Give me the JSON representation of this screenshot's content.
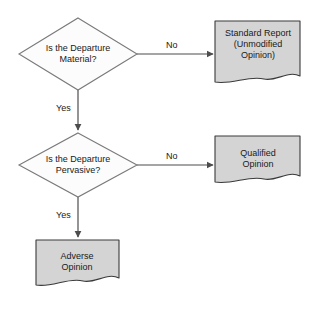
{
  "diagram": {
    "background_color": "#ffffff",
    "decision_fill": "#fcfcfc",
    "decision_stroke": "#7a7a7a",
    "document_fill": "#d4d4d4",
    "document_stroke": "#3a3a3a",
    "connector_color": "#4d4d4d",
    "text_color": "#1a1a1a"
  },
  "nodes": {
    "decision_material": {
      "shape": "diamond",
      "line1": "Is the Departure",
      "line2": "Material?",
      "text": "Is the Departure\nMaterial?"
    },
    "decision_pervasive": {
      "shape": "diamond",
      "line1": "Is the Departure",
      "line2": "Pervasive?",
      "text": "Is the Departure\nPervasive?"
    },
    "doc_standard_report": {
      "shape": "document",
      "line1": "Standard Report",
      "line2": "(Unmodified",
      "line3": "Opinion)",
      "text": "Standard Report\n(Unmodified\nOpinion)"
    },
    "doc_qualified_opinion": {
      "shape": "document",
      "line1": "Qualified",
      "line2": "Opinion",
      "text": "Qualified\nOpinion"
    },
    "doc_adverse_opinion": {
      "shape": "document",
      "line1": "Adverse",
      "line2": "Opinion",
      "text": "Adverse\nOpinion"
    }
  },
  "edges": {
    "material_no": {
      "label": "No",
      "from": "decision_material",
      "to": "doc_standard_report"
    },
    "material_yes": {
      "label": "Yes",
      "from": "decision_material",
      "to": "decision_pervasive"
    },
    "pervasive_no": {
      "label": "No",
      "from": "decision_pervasive",
      "to": "doc_qualified_opinion"
    },
    "pervasive_yes": {
      "label": "Yes",
      "from": "decision_pervasive",
      "to": "doc_adverse_opinion"
    }
  }
}
